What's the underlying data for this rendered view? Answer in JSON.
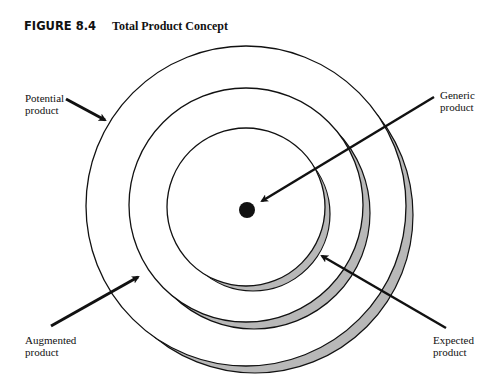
{
  "figure": {
    "number": "FIGURE 8.4",
    "title": "Total Product Concept"
  },
  "diagram": {
    "type": "concentric-circles",
    "center_marker": "filled-dot",
    "rings": [
      {
        "name": "Generic product",
        "level": "core dot"
      },
      {
        "name": "Expected product",
        "level": "inner circle"
      },
      {
        "name": "Augmented product",
        "level": "middle circle"
      },
      {
        "name": "Potential product",
        "level": "outer circle"
      }
    ],
    "shadow_color": "#b8b8b8",
    "line_color": "#111111"
  },
  "labels": {
    "potential": {
      "line1": "Potential",
      "line2": "product"
    },
    "generic": {
      "line1": "Generic",
      "line2": "product"
    },
    "augmented": {
      "line1": "Augmented",
      "line2": "product"
    },
    "expected": {
      "line1": "Expected",
      "line2": "product"
    }
  }
}
